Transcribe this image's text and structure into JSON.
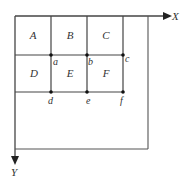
{
  "diagram": {
    "axes": {
      "x_label": "X",
      "y_label": "Y"
    },
    "cells": [
      {
        "label": "A"
      },
      {
        "label": "B"
      },
      {
        "label": "C"
      },
      {
        "label": "D"
      },
      {
        "label": "E"
      },
      {
        "label": "F"
      }
    ],
    "points": [
      {
        "label": "a"
      },
      {
        "label": "b"
      },
      {
        "label": "c"
      },
      {
        "label": "d"
      },
      {
        "label": "e"
      },
      {
        "label": "f"
      }
    ],
    "colors": {
      "line": "#444444",
      "text": "#333333",
      "background": "#ffffff"
    }
  }
}
